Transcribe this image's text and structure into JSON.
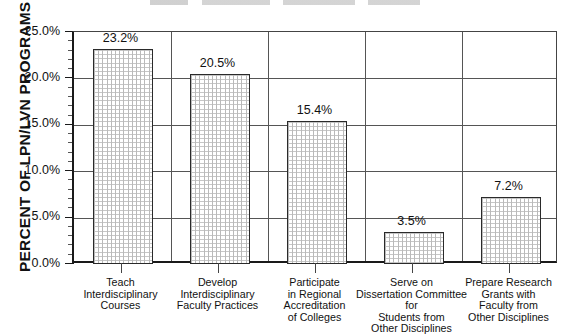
{
  "chart_data": {
    "type": "bar",
    "title": "",
    "xlabel": "",
    "ylabel": "PERCENT OF LPN/LVN PROGRAMS",
    "ylim": [
      0.0,
      25.0
    ],
    "ytick_labels": [
      "0.0%",
      "5.0%",
      "10.0%",
      "15.0%",
      "20.0%",
      "25.0%"
    ],
    "ytick_values": [
      0.0,
      5.0,
      10.0,
      15.0,
      20.0,
      25.0
    ],
    "minor_tick_step": 1.0,
    "grid": "horizontal-and-category-separators",
    "legend": "none",
    "categories": [
      "Teach\nInterdisciplinary\nCourses",
      "Develop\nInterdisciplinary\nFaculty Practices",
      "Participate\nin Regional\nAccreditation\nof Colleges",
      "Serve on\nDissertation Committee for\nStudents from\nOther Disciplines",
      "Prepare Research\nGrants with\nFaculty from\nOther Disciplines"
    ],
    "values": [
      23.2,
      20.5,
      15.4,
      3.5,
      7.2
    ],
    "value_labels": [
      "23.2%",
      "20.5%",
      "15.4%",
      "3.5%",
      "7.2%"
    ],
    "bar_fill": "#ffffff",
    "bar_pattern": "cross-hatch-grid",
    "bar_border": "#2a2a2a",
    "axis_color": "#1a1a1a"
  },
  "categories_display": [
    {
      "lines": [
        "Teach",
        "Interdisciplinary",
        "Courses"
      ]
    },
    {
      "lines": [
        "Develop",
        "Interdisciplinary",
        "Faculty Practices"
      ]
    },
    {
      "lines": [
        "Participate",
        "in Regional",
        "Accreditation",
        "of Colleges"
      ]
    },
    {
      "lines": [
        "Serve on",
        "Dissertation Committee for",
        "Students from",
        "Other Disciplines"
      ]
    },
    {
      "lines": [
        "Prepare Research",
        "Grants with",
        "Faculty from",
        "Other Disciplines"
      ]
    }
  ]
}
